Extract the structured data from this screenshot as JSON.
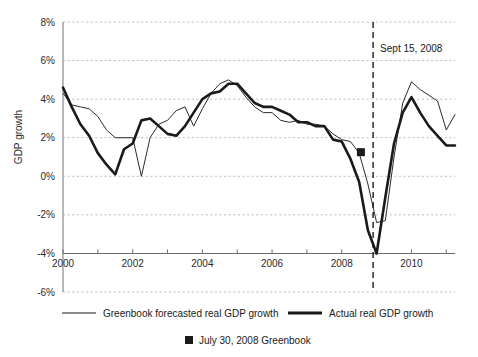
{
  "chart_data": {
    "type": "line",
    "title": "",
    "xlabel": "",
    "ylabel": "GDP growth",
    "xlim": [
      2000.0,
      2011.25
    ],
    "ylim": [
      -6,
      8
    ],
    "ytick_labels": [
      "8%",
      "6%",
      "4%",
      "2%",
      "0%",
      "-2%",
      "-4%",
      "-6%"
    ],
    "ytick_values": [
      8,
      6,
      4,
      2,
      0,
      -2,
      -4,
      -6
    ],
    "xtick_labels": [
      "2000",
      "2002",
      "2004",
      "2006",
      "2008",
      "2010"
    ],
    "xtick_values": [
      2000,
      2002,
      2004,
      2006,
      2008,
      2010
    ],
    "x_minor_ticks": [
      2001,
      2003,
      2005,
      2007,
      2009,
      2011
    ],
    "grid": "horizontal-dashed",
    "axis_baseline_value": -4,
    "legend_position": "below-plot",
    "series": [
      {
        "name": "Greenbook forecasted real GDP growth",
        "style": "thin",
        "color": "#2b2b2b",
        "width": 1,
        "x": [
          2000.0,
          2000.25,
          2000.5,
          2000.75,
          2001.0,
          2001.25,
          2001.5,
          2001.75,
          2002.0,
          2002.25,
          2002.5,
          2002.75,
          2003.0,
          2003.25,
          2003.5,
          2003.75,
          2004.0,
          2004.25,
          2004.5,
          2004.75,
          2005.0,
          2005.25,
          2005.5,
          2005.75,
          2006.0,
          2006.25,
          2006.5,
          2006.75,
          2007.0,
          2007.25,
          2007.5,
          2007.75,
          2008.0,
          2008.25,
          2008.5,
          2008.75,
          2009.0,
          2009.25,
          2009.5,
          2009.75,
          2010.0,
          2010.25,
          2010.5,
          2010.75,
          2011.0,
          2011.25
        ],
        "y": [
          4.3,
          3.7,
          3.6,
          3.5,
          3.1,
          2.4,
          2.0,
          2.0,
          2.0,
          0.0,
          2.0,
          2.7,
          2.9,
          3.4,
          3.6,
          2.6,
          3.5,
          4.3,
          4.8,
          5.0,
          4.7,
          4.1,
          3.6,
          3.3,
          3.3,
          2.9,
          2.8,
          2.9,
          2.7,
          2.7,
          2.6,
          2.2,
          1.9,
          1.8,
          1.2,
          -0.4,
          -2.4,
          -2.3,
          1.0,
          3.8,
          4.9,
          4.5,
          4.2,
          3.9,
          2.4,
          3.2
        ]
      },
      {
        "name": "Actual real GDP growth",
        "style": "thick",
        "color": "#1a1a1a",
        "width": 2.6,
        "x": [
          2000.0,
          2000.25,
          2000.5,
          2000.75,
          2001.0,
          2001.25,
          2001.5,
          2001.75,
          2002.0,
          2002.25,
          2002.5,
          2002.75,
          2003.0,
          2003.25,
          2003.5,
          2003.75,
          2004.0,
          2004.25,
          2004.5,
          2004.75,
          2005.0,
          2005.25,
          2005.5,
          2005.75,
          2006.0,
          2006.25,
          2006.5,
          2006.75,
          2007.0,
          2007.25,
          2007.5,
          2007.75,
          2008.0,
          2008.25,
          2008.5,
          2008.75,
          2009.0,
          2009.25,
          2009.5,
          2009.75,
          2010.0,
          2010.25,
          2010.5,
          2010.75,
          2011.0,
          2011.25
        ],
        "y": [
          4.6,
          3.6,
          2.7,
          2.1,
          1.2,
          0.6,
          0.1,
          1.4,
          1.7,
          2.9,
          3.0,
          2.6,
          2.2,
          2.1,
          2.6,
          3.3,
          4.0,
          4.3,
          4.4,
          4.8,
          4.8,
          4.3,
          3.8,
          3.6,
          3.6,
          3.4,
          3.2,
          2.8,
          2.8,
          2.6,
          2.6,
          1.9,
          1.8,
          0.9,
          -0.3,
          -2.8,
          -4.0,
          -1.1,
          1.7,
          3.3,
          4.1,
          3.3,
          2.6,
          2.1,
          1.6,
          1.6
        ]
      }
    ],
    "markers": [
      {
        "name": "July 30, 2008 Greenbook",
        "shape": "square",
        "color": "#1a1a1a",
        "x": 2008.55,
        "y": 1.25
      }
    ],
    "annotations": [
      {
        "name": "sept-15-2008-event-line",
        "text": "Sept 15, 2008",
        "x": 2008.9,
        "style": "vertical-dashed",
        "text_y": 6.6
      }
    ]
  },
  "legend": {
    "items": [
      {
        "label": "Greenbook forecasted real GDP growth",
        "style": "thin"
      },
      {
        "label": "Actual real GDP growth",
        "style": "thick"
      },
      {
        "label": "July 30, 2008 Greenbook",
        "style": "square"
      }
    ]
  }
}
